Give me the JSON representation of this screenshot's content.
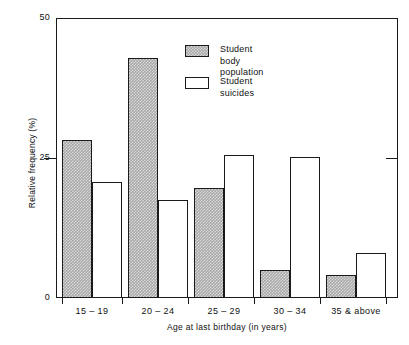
{
  "chart_data": {
    "type": "bar",
    "title": "",
    "subtitle": "",
    "xlabel": "Age at last birthday (in years)",
    "ylabel": "Relative frequency (%)",
    "ylim": [
      0,
      50
    ],
    "yticks": [
      0,
      25,
      50
    ],
    "ytick_labels": [
      "0",
      "25",
      "50"
    ],
    "grid": false,
    "legend_position": "upper center",
    "categories": [
      "15 – 19",
      "20 – 24",
      "25 – 29",
      "30 – 34",
      "35 & above"
    ],
    "series": [
      {
        "name": "Student body population",
        "legend_label": "Student body\n population",
        "fill": "hatched-gray",
        "color": "#a8a8a8",
        "values": [
          28.2,
          42.9,
          19.6,
          5.0,
          4.1
        ]
      },
      {
        "name": "Student suicides",
        "legend_label": "Student suicides",
        "fill": "open-white",
        "color": "#ffffff",
        "values": [
          20.7,
          17.5,
          25.5,
          25.2,
          8.0
        ]
      }
    ]
  },
  "axes": {
    "y_title": "Relative frequency (%)",
    "x_title": "Age at last birthday (in years)",
    "y_labels": [
      "50",
      "25",
      "0"
    ],
    "x_labels": [
      "15 – 19",
      "20 – 24",
      "25 – 29",
      "30 – 34",
      "35 & above"
    ]
  },
  "legend": {
    "items": [
      {
        "label": "Student body\n population",
        "swatch": "hatched-gray-swatch"
      },
      {
        "label": "Student suicides",
        "swatch": "open-white-swatch"
      }
    ]
  },
  "colors": {
    "axis": "#1a1a1a",
    "bar_shaded": "#a8a8a8",
    "bar_open": "#ffffff",
    "background": "#ffffff"
  }
}
